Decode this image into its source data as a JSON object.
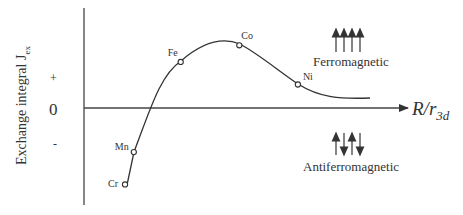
{
  "chart_data": {
    "type": "line",
    "title": "",
    "ylabel": "Exchange integral J",
    "ylabel_sub": "ex",
    "xlabel_main": "R/r",
    "xlabel_sub": "3d",
    "y_ticks": {
      "plus": "+",
      "zero": "0",
      "minus": "-"
    },
    "points": [
      {
        "label": "Cr",
        "x": 0.14,
        "y": -0.78
      },
      {
        "label": "Mn",
        "x": 0.17,
        "y": -0.45
      },
      {
        "label": "Fe",
        "x": 0.33,
        "y": 0.47
      },
      {
        "label": "Co",
        "x": 0.53,
        "y": 0.64
      },
      {
        "label": "Ni",
        "x": 0.73,
        "y": 0.24
      }
    ],
    "curve_tail": {
      "x": 0.98,
      "y": 0.1
    },
    "annotations": {
      "ferro": {
        "label": "Ferromagnetic",
        "arrows": [
          "up",
          "up",
          "up",
          "up"
        ]
      },
      "antiferro": {
        "label": "Antiferromagnetic",
        "arrows": [
          "up",
          "down",
          "up",
          "down"
        ]
      }
    }
  }
}
